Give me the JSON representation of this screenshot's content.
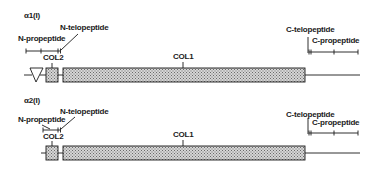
{
  "diagram": {
    "colors": {
      "ink": "#1a1a1a",
      "hatch_fill": "#bdbdbd",
      "background": "#ffffff"
    },
    "chains": [
      {
        "title": "α1(I)",
        "labels": {
          "n_propeptide": "N-propeptide",
          "n_telopeptide": "N-telopeptide",
          "col2": "COL2",
          "col1": "COL1",
          "c_telopeptide": "C-telopeptide",
          "c_propeptide": "C-propeptide"
        },
        "features": [
          "triangle-domain",
          "COL2-box",
          "COL1-box"
        ]
      },
      {
        "title": "α2(I)",
        "labels": {
          "n_propeptide": "N-propeptide",
          "n_telopeptide": "N-telopeptide",
          "col2": "COL2",
          "col1": "COL1",
          "c_telopeptide": "C-telopeptide",
          "c_propeptide": "C-propeptide"
        },
        "features": [
          "COL2-box",
          "COL1-box"
        ]
      }
    ]
  }
}
